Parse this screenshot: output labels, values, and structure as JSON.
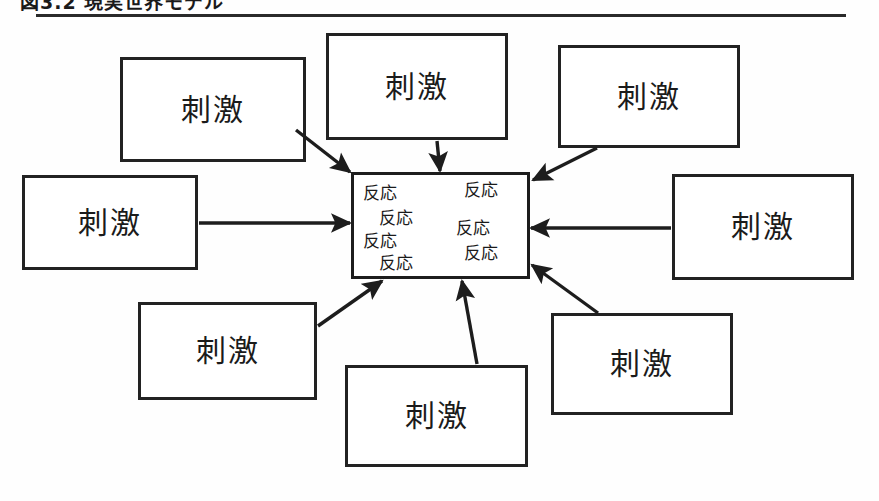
{
  "figure": {
    "caption": "図3.2 現実世界モデル",
    "rule_color": "#2a2a2a"
  },
  "diagram": {
    "type": "radial-stimulus-response",
    "border_color": "#222222",
    "arrow_color": "#1d1d1d",
    "background": "#fefefe",
    "stimulus_label": "刺激",
    "response_label": "反応",
    "stimulus_nodes": [
      {
        "id": "top-left",
        "label": "刺激",
        "x": 120,
        "y": 57,
        "w": 186,
        "h": 105
      },
      {
        "id": "top-center",
        "label": "刺激",
        "x": 326,
        "y": 33,
        "w": 182,
        "h": 107
      },
      {
        "id": "top-right",
        "label": "刺激",
        "x": 558,
        "y": 45,
        "w": 182,
        "h": 103
      },
      {
        "id": "middle-left",
        "label": "刺激",
        "x": 22,
        "y": 175,
        "w": 176,
        "h": 95
      },
      {
        "id": "middle-right",
        "label": "刺激",
        "x": 672,
        "y": 174,
        "w": 182,
        "h": 106
      },
      {
        "id": "bottom-left",
        "label": "刺激",
        "x": 138,
        "y": 302,
        "w": 179,
        "h": 98
      },
      {
        "id": "bottom-center",
        "label": "刺激",
        "x": 345,
        "y": 365,
        "w": 183,
        "h": 102
      },
      {
        "id": "bottom-right",
        "label": "刺激",
        "x": 551,
        "y": 313,
        "w": 182,
        "h": 102
      }
    ],
    "center_node": {
      "id": "response-box",
      "x": 351,
      "y": 172,
      "w": 179,
      "h": 107,
      "responses": [
        {
          "label": "反応",
          "x": 9,
          "y": 10
        },
        {
          "label": "反応",
          "x": 25,
          "y": 35
        },
        {
          "label": "反応",
          "x": 9,
          "y": 58
        },
        {
          "label": "反応",
          "x": 25,
          "y": 80
        },
        {
          "label": "反応",
          "x": 110,
          "y": 7
        },
        {
          "label": "反応",
          "x": 102,
          "y": 45
        },
        {
          "label": "反応",
          "x": 110,
          "y": 70
        }
      ]
    },
    "arrows": [
      {
        "id": "arrow-top-left-to-center",
        "from": "top-left",
        "to": "response-box",
        "x1": 296,
        "y1": 130,
        "x2": 350,
        "y2": 172
      },
      {
        "id": "arrow-top-center-to-center",
        "from": "top-center",
        "to": "response-box",
        "x1": 437,
        "y1": 141,
        "x2": 440,
        "y2": 171
      },
      {
        "id": "arrow-top-right-to-center",
        "from": "top-right",
        "to": "response-box",
        "x1": 597,
        "y1": 148,
        "x2": 533,
        "y2": 180
      },
      {
        "id": "arrow-middle-left-to-center",
        "from": "middle-left",
        "to": "response-box",
        "x1": 199,
        "y1": 223,
        "x2": 350,
        "y2": 223
      },
      {
        "id": "arrow-middle-right-to-center",
        "from": "middle-right",
        "to": "response-box",
        "x1": 671,
        "y1": 228,
        "x2": 531,
        "y2": 228
      },
      {
        "id": "arrow-bottom-left-to-center",
        "from": "bottom-left",
        "to": "response-box",
        "x1": 318,
        "y1": 326,
        "x2": 382,
        "y2": 281
      },
      {
        "id": "arrow-bottom-center-to-center",
        "from": "bottom-center",
        "to": "response-box",
        "x1": 477,
        "y1": 364,
        "x2": 462,
        "y2": 281
      },
      {
        "id": "arrow-bottom-right-to-center",
        "from": "bottom-right",
        "to": "response-box",
        "x1": 598,
        "y1": 313,
        "x2": 532,
        "y2": 265
      }
    ]
  }
}
